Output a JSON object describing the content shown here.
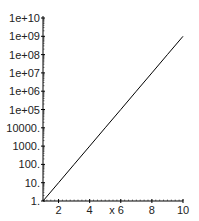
{
  "chart_data": {
    "type": "line",
    "title": "",
    "xlabel": "x",
    "ylabel": "",
    "yscale": "log",
    "xlim": [
      1,
      10
    ],
    "ylim": [
      1,
      10000000000
    ],
    "grid": false,
    "legend": null,
    "x_ticks": [
      "2",
      "4",
      "6",
      "8",
      "10"
    ],
    "x_tick_values": [
      2,
      4,
      6,
      8,
      10
    ],
    "y_ticks": [
      "1.",
      "10.",
      "100.",
      "1000.",
      "10000.",
      "1e+05",
      "1e+06",
      "1e+07",
      "1e+08",
      "1e+09",
      "1e+10"
    ],
    "y_tick_values": [
      1,
      10,
      100,
      1000,
      10000,
      100000,
      1000000,
      10000000,
      100000000,
      1000000000,
      10000000000
    ],
    "series": [
      {
        "name": "10^(x-1)",
        "color": "#000000",
        "x": [
          1,
          2,
          3,
          4,
          5,
          6,
          7,
          8,
          9,
          10
        ],
        "values": [
          1,
          10,
          100,
          1000,
          10000,
          100000,
          1000000,
          10000000,
          100000000,
          1000000000
        ]
      }
    ]
  },
  "colors": {
    "axis": "#000000",
    "line": "#000000",
    "text": "#222222"
  }
}
